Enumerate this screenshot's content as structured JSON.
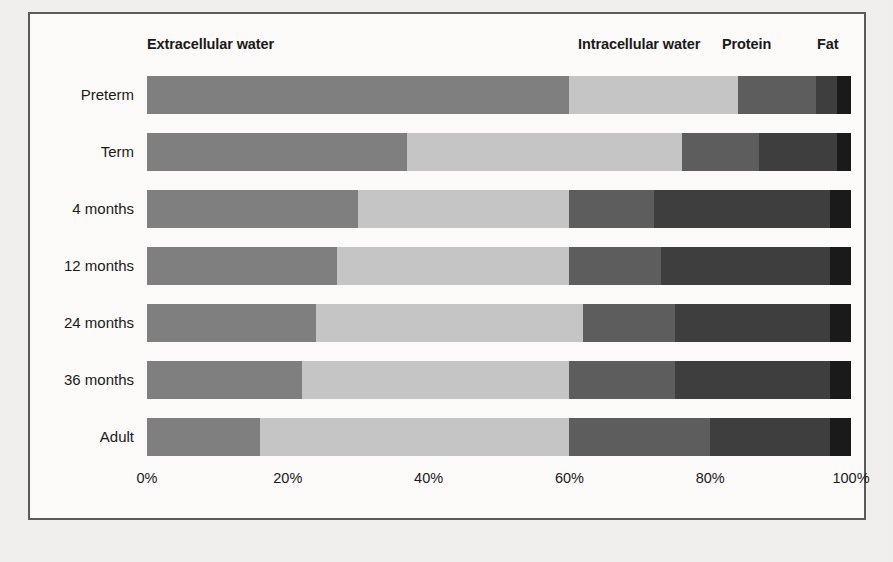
{
  "legend": {
    "items": [
      {
        "label": "Extracellular water",
        "color": "#808080",
        "key": "ecw"
      },
      {
        "label": "Intracellular water",
        "color": "#c6c6c6",
        "key": "icw"
      },
      {
        "label": "Protein",
        "color": "#5e5e5e",
        "key": "protein"
      },
      {
        "label": "Fat",
        "color": "#3f3f3f",
        "key": "fat"
      }
    ]
  },
  "axis": {
    "ticks": [
      "0%",
      "20%",
      "40%",
      "60%",
      "80%",
      "100%"
    ],
    "tick_values": [
      0,
      20,
      40,
      60,
      80,
      100
    ]
  },
  "chart_data": {
    "type": "bar",
    "orientation": "horizontal",
    "stacked": true,
    "stack_mode": "percent",
    "title": "",
    "xlabel": "",
    "ylabel": "",
    "xlim": [
      0,
      100
    ],
    "grid": false,
    "legend_position": "top",
    "categories": [
      "Preterm",
      "Term",
      "4 months",
      "12 months",
      "24 months",
      "36 months",
      "Adult"
    ],
    "series": [
      {
        "name": "Extracellular water",
        "color": "#808080",
        "values": [
          60,
          37,
          30,
          27,
          24,
          22,
          16
        ]
      },
      {
        "name": "Intracellular water",
        "color": "#c6c6c6",
        "values": [
          24,
          39,
          30,
          33,
          38,
          38,
          44
        ]
      },
      {
        "name": "Protein",
        "color": "#5e5e5e",
        "values": [
          11,
          11,
          12,
          13,
          13,
          15,
          20
        ]
      },
      {
        "name": "Fat",
        "color": "#3f3f3f",
        "values": [
          3,
          11,
          25,
          24,
          22,
          22,
          17
        ]
      },
      {
        "name": "Fat (end band)",
        "color": "#1b1b1b",
        "values": [
          2,
          2,
          3,
          3,
          3,
          3,
          3
        ]
      }
    ]
  }
}
